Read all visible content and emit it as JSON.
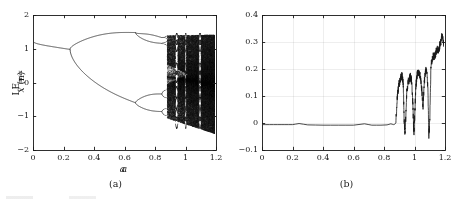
{
  "figure": {
    "background": "#ffffff",
    "ink": "#1a1a1a"
  },
  "panels": [
    {
      "id": "a",
      "caption": "(a)",
      "xlabel": "a",
      "ylabel_main": "x",
      "ylabel_arg": "(n)",
      "ylabel_text": "x (n)"
    },
    {
      "id": "b",
      "caption": "(b)",
      "xlabel": "a",
      "ylabel_main": "LE",
      "ylabel_sub": "max",
      "ylabel_text": "LEmax"
    }
  ],
  "chart_data": [
    {
      "type": "scatter",
      "title": "",
      "panel": "a",
      "xlabel": "a",
      "ylabel": "x (n)",
      "xlim": [
        0,
        1.2
      ],
      "ylim": [
        -2,
        2
      ],
      "xticks": [
        0,
        0.2,
        0.4,
        0.6,
        0.8,
        1,
        1.2
      ],
      "xticklabels": [
        "0",
        "0.2",
        "0.4",
        "0.6",
        "0.8",
        "1",
        "1.2"
      ],
      "yticks": [
        -2,
        -1,
        0,
        1,
        2
      ],
      "yticklabels": [
        "-2",
        "-1",
        "0",
        "1",
        "2"
      ],
      "grid": false,
      "description": "Bifurcation diagram showing period-doubling route to chaos",
      "regimes": [
        {
          "name": "period-1",
          "a_start": 0.0,
          "a_end": 0.243,
          "branches": [
            [
              1.22,
              0.98
            ]
          ]
        },
        {
          "name": "period-2",
          "a_start": 0.243,
          "a_end": 0.672,
          "branches": [
            [
              0.99,
              1.48
            ],
            [
              0.99,
              -0.6
            ]
          ]
        },
        {
          "name": "period-4",
          "a_start": 0.672,
          "a_end": 0.845,
          "branches": [
            [
              1.48,
              1.33
            ],
            [
              1.48,
              1.16
            ],
            [
              -0.6,
              -0.34
            ],
            [
              -0.6,
              -0.86
            ]
          ]
        },
        {
          "name": "period-8",
          "a_start": 0.845,
          "a_end": 0.878,
          "branches": [
            [
              1.33,
              1.3
            ],
            [
              1.33,
              1.38
            ],
            [
              1.16,
              1.1
            ],
            [
              1.16,
              1.22
            ],
            [
              -0.34,
              -0.22
            ],
            [
              -0.34,
              -0.45
            ],
            [
              -0.86,
              -0.78
            ],
            [
              -0.86,
              -0.98
            ]
          ]
        },
        {
          "name": "chaos",
          "a_start": 0.878,
          "a_end": 1.2,
          "band_upper": [
            1.4,
            1.42
          ],
          "band_lower": [
            -1.05,
            -1.52
          ]
        }
      ],
      "periodic_windows": [
        {
          "a_start": 0.932,
          "a_end": 0.948
        },
        {
          "a_start": 0.995,
          "a_end": 1.004
        },
        {
          "a_start": 1.086,
          "a_end": 1.1
        }
      ]
    },
    {
      "type": "line",
      "title": "",
      "panel": "b",
      "xlabel": "a",
      "ylabel": "LEmax",
      "xlim": [
        0,
        1.2
      ],
      "ylim": [
        -0.1,
        0.4
      ],
      "xticks": [
        0,
        0.2,
        0.4,
        0.6,
        0.8,
        1,
        1.2
      ],
      "xticklabels": [
        "0",
        "0.2",
        "0.4",
        "0.6",
        "0.8",
        "1",
        "1.2"
      ],
      "yticks": [
        -0.1,
        0,
        0.1,
        0.2,
        0.3,
        0.4
      ],
      "yticklabels": [
        "-0.1",
        "0",
        "0.1",
        "0.2",
        "0.3",
        "0.4"
      ],
      "grid": true,
      "description": "Maximum Lyapunov exponent versus parameter a",
      "series": [
        {
          "name": "LEmax",
          "x": [
            0.0,
            0.05,
            0.1,
            0.15,
            0.2,
            0.243,
            0.3,
            0.4,
            0.5,
            0.6,
            0.672,
            0.72,
            0.78,
            0.82,
            0.845,
            0.862,
            0.872,
            0.878,
            0.886,
            0.894,
            0.902,
            0.91,
            0.918,
            0.926,
            0.932,
            0.938,
            0.944,
            0.95,
            0.958,
            0.966,
            0.974,
            0.982,
            0.99,
            0.996,
            1.002,
            1.008,
            1.016,
            1.024,
            1.032,
            1.04,
            1.048,
            1.056,
            1.064,
            1.072,
            1.08,
            1.088,
            1.094,
            1.1,
            1.108,
            1.116,
            1.124,
            1.132,
            1.14,
            1.148,
            1.156,
            1.164,
            1.172,
            1.18,
            1.19,
            1.2
          ],
          "y": [
            -0.006,
            -0.006,
            -0.006,
            -0.006,
            -0.006,
            -0.002,
            -0.007,
            -0.008,
            -0.008,
            -0.008,
            -0.003,
            -0.008,
            -0.008,
            -0.007,
            -0.003,
            -0.006,
            -0.004,
            0.0,
            0.09,
            0.13,
            0.152,
            0.168,
            0.175,
            0.15,
            0.01,
            -0.04,
            0.04,
            0.12,
            0.15,
            0.165,
            0.172,
            0.15,
            0.06,
            -0.045,
            0.03,
            0.13,
            0.175,
            0.19,
            0.185,
            0.16,
            0.12,
            0.06,
            0.15,
            0.19,
            0.205,
            0.12,
            -0.05,
            0.01,
            0.215,
            0.235,
            0.25,
            0.245,
            0.26,
            0.272,
            0.268,
            0.285,
            0.3,
            0.33,
            0.3,
            0.285
          ]
        }
      ],
      "baseline_value": -0.006,
      "chaos_onset_a": 0.878
    }
  ]
}
